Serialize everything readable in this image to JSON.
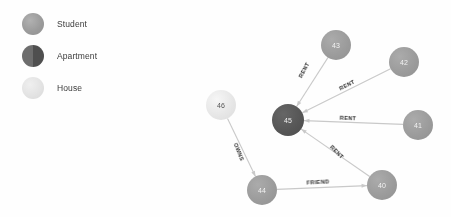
{
  "legend": {
    "items": [
      {
        "label": "Student",
        "color": "#9b9b9b",
        "icon": "circle-icon"
      },
      {
        "label": "Apartment",
        "color": "#6d6d6d",
        "icon": "circle-icon"
      },
      {
        "label": "House",
        "color": "#e2e2e2",
        "icon": "circle-icon"
      }
    ]
  },
  "chart_data": {
    "type": "graph",
    "title": "",
    "nodes": [
      {
        "id": "43",
        "label": "43",
        "type": "Student",
        "color": "#9b9b9b",
        "x": 336,
        "y": 45,
        "r": 15
      },
      {
        "id": "42",
        "label": "42",
        "type": "Student",
        "color": "#9b9b9b",
        "x": 404,
        "y": 62,
        "r": 15
      },
      {
        "id": "41",
        "label": "41",
        "type": "Student",
        "color": "#9b9b9b",
        "x": 418,
        "y": 125,
        "r": 15
      },
      {
        "id": "40",
        "label": "40",
        "type": "Student",
        "color": "#9b9b9b",
        "x": 382,
        "y": 185,
        "r": 15
      },
      {
        "id": "44",
        "label": "44",
        "type": "Student",
        "color": "#9b9b9b",
        "x": 262,
        "y": 190,
        "r": 15
      },
      {
        "id": "46",
        "label": "46",
        "type": "House",
        "color": "#e6e6e6",
        "x": 221,
        "y": 105,
        "r": 15
      },
      {
        "id": "45",
        "label": "45",
        "type": "Apartment",
        "color": "#565656",
        "x": 288,
        "y": 120,
        "r": 16
      }
    ],
    "edges": [
      {
        "source": "43",
        "target": "45",
        "label": "RENT",
        "angle": -62
      },
      {
        "source": "42",
        "target": "45",
        "label": "RENT",
        "angle": -27
      },
      {
        "source": "41",
        "target": "45",
        "label": "RENT",
        "angle": 2
      },
      {
        "source": "40",
        "target": "45",
        "label": "RENT",
        "angle": 45
      },
      {
        "source": "44",
        "target": "40",
        "label": "FRIEND",
        "angle": -3
      },
      {
        "source": "46",
        "target": "44",
        "label": "OWNS",
        "angle": 68
      }
    ],
    "edge_label_positions": [
      {
        "label": "RENT",
        "x": 304,
        "y": 70
      },
      {
        "label": "RENT",
        "x": 347,
        "y": 85
      },
      {
        "label": "RENT",
        "x": 348,
        "y": 118
      },
      {
        "label": "RENT",
        "x": 337,
        "y": 152
      },
      {
        "label": "FRIEND",
        "x": 318,
        "y": 182
      },
      {
        "label": "OWNS",
        "x": 239,
        "y": 152
      }
    ],
    "node_fill_student": "#9b9b9b",
    "node_fill_apartment": "#565656",
    "node_fill_house": "#e6e6e6",
    "edge_color": "#c9c9c9",
    "background": "#fefefe"
  }
}
